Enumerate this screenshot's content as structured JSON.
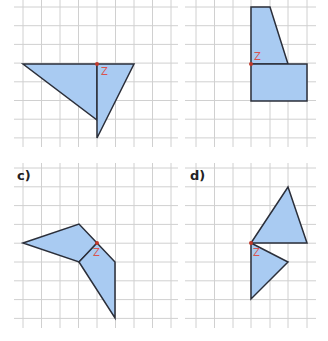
{
  "colors": {
    "fill": "#a9cbf2",
    "stroke": "#2b2f3a",
    "grid": "#cfcfcf",
    "point": "#c0392b",
    "label": "#d9534f"
  },
  "panels": [
    {
      "id": "a",
      "label": "",
      "point_label": "Z"
    },
    {
      "id": "b",
      "label": "",
      "point_label": "Z"
    },
    {
      "id": "c",
      "label": "c)",
      "point_label": "Z"
    },
    {
      "id": "d",
      "label": "d)",
      "point_label": "Z"
    }
  ]
}
